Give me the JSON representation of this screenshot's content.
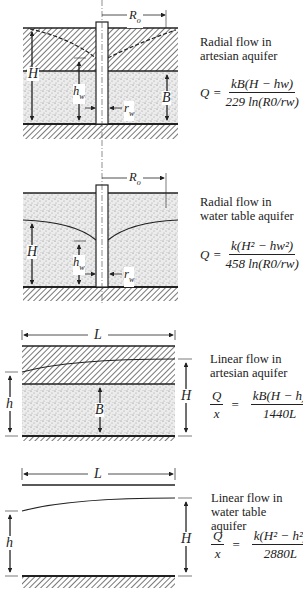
{
  "panels": [
    {
      "id": "radial-artesian",
      "caption_line1": "Radial flow in",
      "caption_line2": "artesian aquifer",
      "equation": {
        "lhs": "Q =",
        "numerator": "kB(H − hw)",
        "denominator": "229 ln(R0/rw)"
      },
      "labels": {
        "R": "R",
        "R_sub": "o",
        "H": "H",
        "hw": "h",
        "hw_sub": "w",
        "rw": "r",
        "rw_sub": "w",
        "B": "B"
      }
    },
    {
      "id": "radial-water-table",
      "caption_line1": "Radial flow in",
      "caption_line2": "water table aquifer",
      "equation": {
        "lhs": "Q =",
        "numerator": "k(H² − hw²)",
        "denominator": "458 ln(R0/rw)"
      },
      "labels": {
        "R": "R",
        "R_sub": "o",
        "H": "H",
        "hw": "h",
        "hw_sub": "w",
        "rw": "r",
        "rw_sub": "w"
      }
    },
    {
      "id": "linear-artesian",
      "caption_line1": "Linear flow in",
      "caption_line2": "artesian aquifer",
      "equation": {
        "lhs_num": "Q",
        "lhs_den": "x",
        "eq": "=",
        "numerator": "kB(H − h)",
        "denominator": "1440L"
      },
      "labels": {
        "L": "L",
        "h": "h",
        "B": "B",
        "H": "H"
      }
    },
    {
      "id": "linear-water-table",
      "caption_line1": "Linear flow in",
      "caption_line2": "water table aquifer",
      "equation": {
        "lhs_num": "Q",
        "lhs_den": "x",
        "eq": "=",
        "numerator": "k(H² − h²)",
        "denominator": "2880L"
      },
      "labels": {
        "L": "L",
        "h": "h",
        "H": "H"
      }
    }
  ],
  "colors": {
    "ink": "#222222",
    "sand": "#e4e4e4",
    "hatch": "#555555"
  }
}
